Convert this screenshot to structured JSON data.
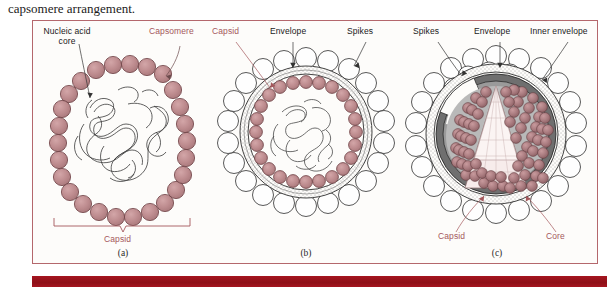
{
  "caption": {
    "text": "capsomere arrangement."
  },
  "figure": {
    "panels": [
      {
        "letter": "(a)",
        "type": "naked-icosahedral-virus",
        "labels": [
          {
            "name": "nucleic-acid-core",
            "text": "Nucleic acid core",
            "color": "#1a1a1a"
          },
          {
            "name": "capsomere",
            "text": "Capsomere",
            "color": "#a4585c"
          },
          {
            "name": "capsid-bracket",
            "text": "Capsid",
            "color": "#a4585c"
          }
        ]
      },
      {
        "letter": "(b)",
        "type": "enveloped-virus",
        "labels": [
          {
            "name": "capsid",
            "text": "Capsid",
            "color": "#a4585c"
          },
          {
            "name": "envelope",
            "text": "Envelope",
            "color": "#1a1a1a"
          },
          {
            "name": "spikes",
            "text": "Spikes",
            "color": "#1a1a1a"
          }
        ]
      },
      {
        "letter": "(c)",
        "type": "cutaway-enveloped-virus-with-conical-core",
        "labels": [
          {
            "name": "spikes",
            "text": "Spikes",
            "color": "#1a1a1a"
          },
          {
            "name": "envelope",
            "text": "Envelope",
            "color": "#1a1a1a"
          },
          {
            "name": "inner-envelope",
            "text": "Inner envelope",
            "color": "#1a1a1a"
          },
          {
            "name": "capsid",
            "text": "Capsid",
            "color": "#a4585c"
          },
          {
            "name": "core",
            "text": "Core",
            "color": "#a4585c"
          }
        ]
      }
    ]
  },
  "colors": {
    "capsomere_fill": "#bd8b8e",
    "capsomere_stroke": "#6d4044",
    "label_red": "#a4585c",
    "border_red": "#b4676c",
    "bottom_bar": "#a5151f",
    "envelope_gray": "#8e8e8e",
    "inner_gray": "#a8a8a8",
    "core_pale": "#f6e9ea",
    "page_bg": "#fdfcfa"
  }
}
